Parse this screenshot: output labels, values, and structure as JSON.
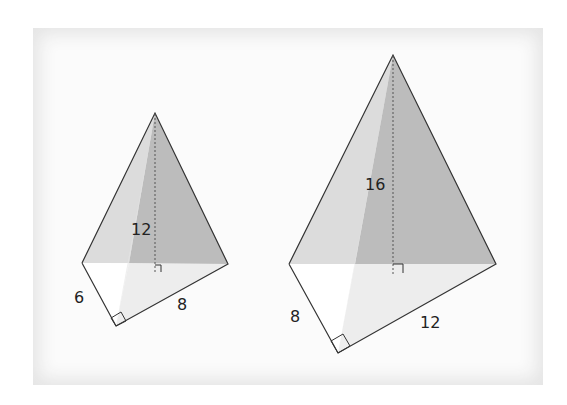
{
  "figure": {
    "pyramids": [
      {
        "name": "small",
        "height_label": "12",
        "base_leg_a": "6",
        "base_leg_b": "8"
      },
      {
        "name": "large",
        "height_label": "16",
        "base_leg_a": "8",
        "base_leg_b": "12"
      }
    ]
  },
  "colors": {
    "face_light": "#e0e0e0",
    "face_dark": "#bdbdbd",
    "base": "#ececec",
    "edge": "#333333"
  }
}
